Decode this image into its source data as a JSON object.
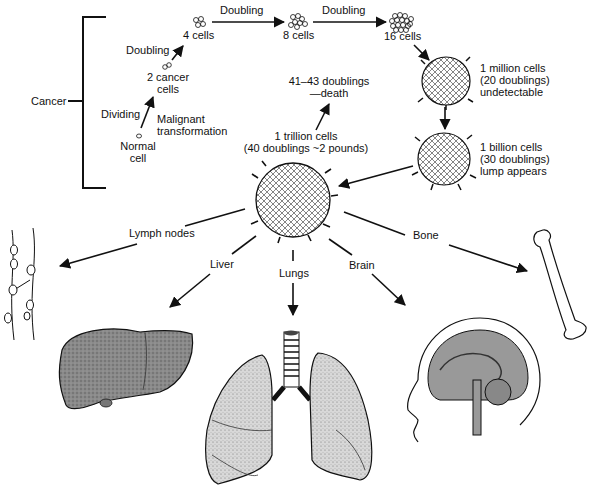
{
  "diagram": {
    "bracket_label": "Cancer",
    "stages": {
      "normal_cell": "Normal\ncell",
      "dividing": "Dividing",
      "malignant": "Malignant\ntransformation",
      "two_cells": "2 cancer\ncells",
      "doubling_1": "Doubling",
      "four_cells": "4 cells",
      "doubling_2": "Doubling",
      "eight_cells": "8 cells",
      "doubling_3": "Doubling",
      "sixteen_cells": "16 cells",
      "million": "1 million cells\n(20 doublings)\nundetectable",
      "billion": "1 billion cells\n(30 doublings)\nlump appears",
      "trillion": "1 trillion cells\n(40 doublings ~2 pounds)",
      "death": "41–43 doublings\n—death"
    },
    "metastasis_sites": {
      "lymph": "Lymph nodes",
      "liver": "Liver",
      "lungs": "Lungs",
      "brain": "Brain",
      "bone": "Bone"
    }
  }
}
